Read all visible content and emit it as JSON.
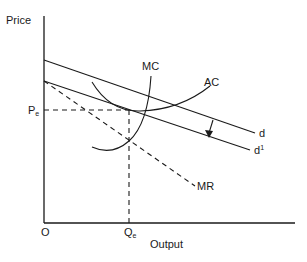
{
  "diagram": {
    "axes": {
      "y_label": "Price",
      "x_label": "Output",
      "origin_label": "O"
    },
    "curves": {
      "demand": "d",
      "demand_shifted": "d",
      "demand_shifted_prime": "1",
      "marginal_cost": "MC",
      "average_cost": "AC",
      "marginal_revenue": "MR"
    },
    "equilibrium": {
      "price_label": "P",
      "price_sub": "e",
      "quantity_label": "Q",
      "quantity_sub": "e"
    },
    "colors": {
      "line": "#1a1a1a",
      "background": "#ffffff"
    }
  }
}
